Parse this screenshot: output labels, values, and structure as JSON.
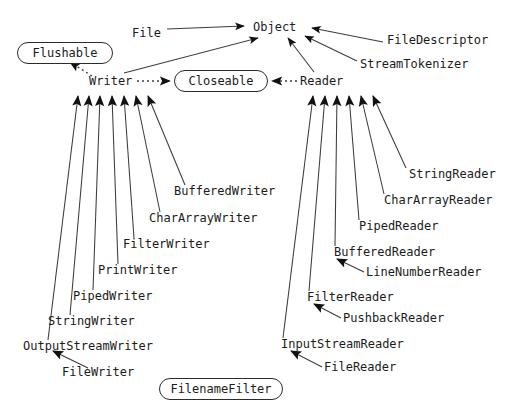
{
  "diagram": {
    "background_color": "#ffffff",
    "line_color": "#3c3c3c",
    "text_color": "#1b1b1b",
    "nodes": {
      "object": "Object",
      "file": "File",
      "file_descriptor": "FileDescriptor",
      "stream_tokenizer": "StreamTokenizer",
      "flushable": "Flushable",
      "writer": "Writer",
      "closeable": "Closeable",
      "reader": "Reader",
      "buffered_writer": "BufferedWriter",
      "char_array_writer": "CharArrayWriter",
      "filter_writer": "FilterWriter",
      "print_writer": "PrintWriter",
      "piped_writer": "PipedWriter",
      "string_writer": "StringWriter",
      "output_stream_writer": "OutputStreamWriter",
      "file_writer": "FileWriter",
      "string_reader": "StringReader",
      "char_array_reader": "CharArrayReader",
      "piped_reader": "PipedReader",
      "buffered_reader": "BufferedReader",
      "line_number_reader": "LineNumberReader",
      "filter_reader": "FilterReader",
      "pushback_reader": "PushbackReader",
      "input_stream_reader": "InputStreamReader",
      "file_reader": "FileReader",
      "filename_filter": "FilenameFilter"
    }
  }
}
